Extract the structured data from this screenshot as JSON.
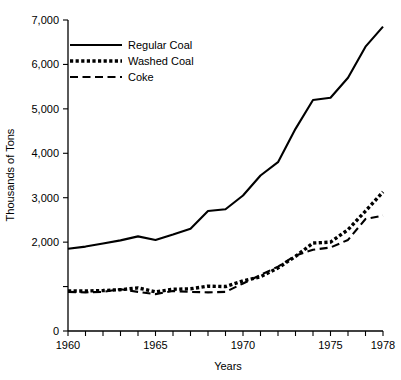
{
  "chart_data": {
    "type": "line",
    "title": "",
    "xlabel": "Years",
    "ylabel": "Thousands of Tons",
    "xlim": [
      1960,
      1978
    ],
    "ylim": [
      0,
      7000
    ],
    "grid": false,
    "legend_position": "top-left",
    "y_ticks": [
      0,
      2000,
      3000,
      4000,
      5000,
      6000,
      7000
    ],
    "y_tick_labels": [
      "0",
      "2,000",
      "3,000",
      "4,000",
      "5,000",
      "6,000",
      "7,000"
    ],
    "y_minor_ticks": [
      1000
    ],
    "x_ticks": [
      1960,
      1961,
      1962,
      1963,
      1964,
      1965,
      1966,
      1967,
      1968,
      1969,
      1970,
      1971,
      1972,
      1973,
      1974,
      1975,
      1976,
      1977,
      1978
    ],
    "x_tick_labels": [
      "1960",
      "1965",
      "1970",
      "1975",
      "1978"
    ],
    "x_labeled_ticks": [
      1960,
      1965,
      1970,
      1975,
      1978
    ],
    "x": [
      1960,
      1961,
      1962,
      1963,
      1964,
      1965,
      1966,
      1967,
      1968,
      1969,
      1970,
      1971,
      1972,
      1973,
      1974,
      1975,
      1976,
      1977,
      1978
    ],
    "series": [
      {
        "name": "Regular Coal",
        "style": "solid",
        "values": [
          1850,
          1900,
          1970,
          2040,
          2130,
          2050,
          2170,
          2300,
          2700,
          2740,
          3050,
          3500,
          3800,
          4550,
          5200,
          5250,
          5700,
          6400,
          6850
        ]
      },
      {
        "name": "Washed Coal",
        "style": "dotted",
        "values": [
          900,
          900,
          910,
          930,
          970,
          880,
          940,
          950,
          1010,
          1000,
          1130,
          1220,
          1420,
          1680,
          1980,
          2000,
          2280,
          2700,
          3130
        ]
      },
      {
        "name": "Coke",
        "style": "dashed",
        "values": [
          880,
          870,
          880,
          940,
          880,
          830,
          900,
          880,
          870,
          880,
          1070,
          1260,
          1450,
          1700,
          1830,
          1880,
          2050,
          2520,
          2600
        ]
      }
    ]
  },
  "legend": {
    "items": [
      {
        "label": "Regular Coal",
        "style": "solid"
      },
      {
        "label": "Washed Coal",
        "style": "dotted"
      },
      {
        "label": "Coke",
        "style": "dashed"
      }
    ]
  },
  "axes": {
    "y_title": "Thousands of Tons",
    "x_title": "Years"
  }
}
